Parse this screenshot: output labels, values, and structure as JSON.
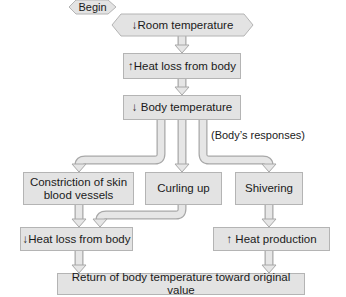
{
  "diagram": {
    "colors": {
      "box_fill": "#e3e3e3",
      "box_border": "#b4b4b4",
      "arrow_fill": "#e6e6e6",
      "arrow_stroke": "#a8a8a8",
      "text": "#1a1a1a"
    },
    "nodes": {
      "begin": "Begin",
      "room_temp": "↓Room temperature",
      "heat_loss_up": "↑Heat loss from body",
      "body_temp": "↓ Body temperature",
      "constriction": "Constriction of skin blood vessels",
      "curling": "Curling up",
      "shivering": "Shivering",
      "heat_loss_down": "↓Heat loss from body",
      "heat_production": "↑ Heat production",
      "return": "Return of body temperature toward original value"
    },
    "annotations": {
      "responses": "(Body’s responses)"
    },
    "edges": [
      {
        "from": "begin",
        "to": "room_temp"
      },
      {
        "from": "room_temp",
        "to": "heat_loss_up"
      },
      {
        "from": "heat_loss_up",
        "to": "body_temp"
      },
      {
        "from": "body_temp",
        "to": "constriction"
      },
      {
        "from": "body_temp",
        "to": "curling"
      },
      {
        "from": "body_temp",
        "to": "shivering"
      },
      {
        "from": "constriction",
        "to": "heat_loss_down"
      },
      {
        "from": "curling",
        "to": "heat_loss_down"
      },
      {
        "from": "shivering",
        "to": "heat_production"
      },
      {
        "from": "heat_loss_down",
        "to": "return"
      },
      {
        "from": "heat_production",
        "to": "return"
      }
    ]
  }
}
